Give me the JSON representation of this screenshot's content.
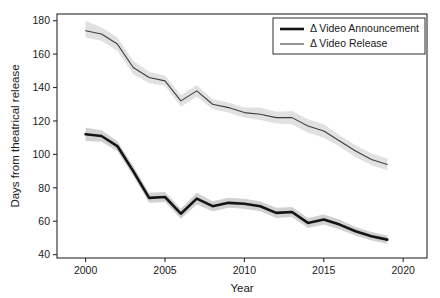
{
  "chart_data": {
    "type": "line",
    "title": "",
    "xlabel": "Year",
    "ylabel": "Days from theatrical release",
    "xlim": [
      1998.2,
      2021.5
    ],
    "ylim": [
      38,
      184
    ],
    "xticks": [
      2000,
      2005,
      2010,
      2015,
      2020
    ],
    "xtick_labels": [
      "2000",
      "2005",
      "2010",
      "2015",
      "2020"
    ],
    "yticks": [
      40,
      60,
      80,
      100,
      120,
      140,
      160,
      180
    ],
    "ytick_labels": [
      "40",
      "60",
      "80",
      "100",
      "120",
      "140",
      "160",
      "180"
    ],
    "grid": false,
    "legend_position": "top-right",
    "x": [
      2000,
      2001,
      2002,
      2003,
      2004,
      2005,
      2006,
      2007,
      2008,
      2009,
      2010,
      2011,
      2012,
      2013,
      2014,
      2015,
      2016,
      2017,
      2018,
      2019
    ],
    "series": [
      {
        "name": "Δ Video Announcement",
        "color": "#141414",
        "line_width": 2.6,
        "band_color": "#c9c9c9",
        "values": [
          112,
          111,
          105,
          90,
          74,
          74.5,
          64.5,
          73.5,
          69,
          71,
          70.5,
          69,
          65,
          65.5,
          59,
          61,
          58,
          54,
          51,
          49
        ],
        "lower": [
          108,
          107.5,
          102,
          87,
          71,
          71.5,
          61.5,
          70,
          66,
          68,
          67.5,
          66,
          62,
          62.5,
          56,
          58,
          55,
          51.5,
          48.5,
          46.5
        ],
        "upper": [
          116,
          114.5,
          108,
          93,
          77,
          77.5,
          67.5,
          77,
          72,
          74,
          73.5,
          72,
          68,
          68.5,
          62,
          64,
          61,
          56.5,
          53.5,
          51.5
        ]
      },
      {
        "name": "Δ Video Release",
        "color": "#3f3f3f",
        "line_width": 1.1,
        "band_color": "#dcdcdc",
        "values": [
          174,
          172,
          166,
          152,
          146,
          144,
          132,
          138,
          130,
          128,
          125,
          124,
          122,
          122,
          117,
          114,
          108,
          102,
          97,
          94
        ],
        "lower": [
          170,
          168,
          162,
          148,
          142.5,
          141,
          128.5,
          134.5,
          127,
          125,
          122,
          120.5,
          118.5,
          118,
          113,
          110,
          104.5,
          98.5,
          93.5,
          90.5
        ],
        "upper": [
          180,
          176,
          170,
          156,
          149.5,
          147,
          135.5,
          141.5,
          133,
          131,
          128,
          128,
          125.5,
          126,
          121,
          118,
          111.5,
          105.5,
          100.5,
          97.5
        ]
      }
    ]
  },
  "legend": {
    "entries": [
      {
        "label": "Δ Video Announcement"
      },
      {
        "label": "Δ Video Release"
      }
    ]
  },
  "axes": {
    "x_title": "Year",
    "y_title": "Days from theatrical release"
  }
}
